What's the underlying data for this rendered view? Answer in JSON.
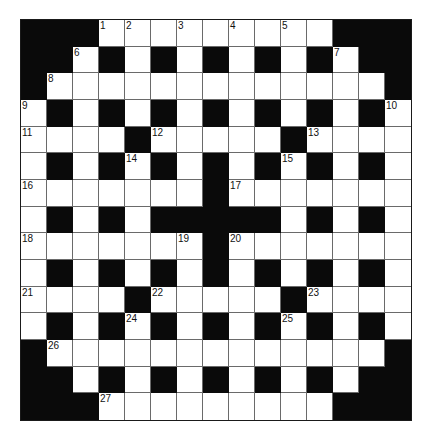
{
  "puzzle": {
    "rows": 15,
    "cols": 15,
    "grid": [
      "###.........###",
      "##.#.#.#.#.#.##",
      "#.............#",
      ".#.#.#.#.#.#.#.",
      "....#.....#....",
      ".#.#.#.#.#.#.#.",
      ".......#.......",
      ".#.#.#####.#.#.",
      ".......#.......",
      ".#.#.#.#.#.#.#.",
      "....#.....#....",
      ".#.#.#.#.#.#.#.",
      "#.............#",
      "##.#.#.#.#.#.##",
      "###.........###"
    ],
    "numbers": [
      {
        "n": "1",
        "r": 0,
        "c": 3
      },
      {
        "n": "2",
        "r": 0,
        "c": 4
      },
      {
        "n": "3",
        "r": 0,
        "c": 6
      },
      {
        "n": "4",
        "r": 0,
        "c": 8
      },
      {
        "n": "5",
        "r": 0,
        "c": 10
      },
      {
        "n": "6",
        "r": 1,
        "c": 2
      },
      {
        "n": "7",
        "r": 1,
        "c": 12
      },
      {
        "n": "8",
        "r": 2,
        "c": 1
      },
      {
        "n": "9",
        "r": 3,
        "c": 0
      },
      {
        "n": "10",
        "r": 3,
        "c": 14
      },
      {
        "n": "11",
        "r": 4,
        "c": 0
      },
      {
        "n": "12",
        "r": 4,
        "c": 5
      },
      {
        "n": "13",
        "r": 4,
        "c": 11
      },
      {
        "n": "14",
        "r": 5,
        "c": 4
      },
      {
        "n": "15",
        "r": 5,
        "c": 10
      },
      {
        "n": "16",
        "r": 6,
        "c": 0
      },
      {
        "n": "17",
        "r": 6,
        "c": 8
      },
      {
        "n": "18",
        "r": 8,
        "c": 0
      },
      {
        "n": "19",
        "r": 8,
        "c": 6
      },
      {
        "n": "20",
        "r": 8,
        "c": 8
      },
      {
        "n": "21",
        "r": 10,
        "c": 0
      },
      {
        "n": "22",
        "r": 10,
        "c": 5
      },
      {
        "n": "23",
        "r": 10,
        "c": 11
      },
      {
        "n": "24",
        "r": 11,
        "c": 4
      },
      {
        "n": "25",
        "r": 11,
        "c": 10
      },
      {
        "n": "26",
        "r": 12,
        "c": 1
      },
      {
        "n": "27",
        "r": 14,
        "c": 3
      }
    ],
    "colors": {
      "block": "#0a0a0a",
      "cell": "#ffffff",
      "gridline": "#6a6a6a"
    }
  }
}
